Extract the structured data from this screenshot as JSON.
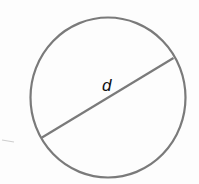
{
  "diagram": {
    "type": "circle-with-diameter",
    "circle": {
      "cx": 108,
      "cy": 97.5,
      "rx": 77.5,
      "ry": 80,
      "stroke": "#7a7a7a",
      "stroke_width": 2.2
    },
    "diameter": {
      "x1": 42,
      "y1": 137.5,
      "x2": 173.5,
      "y2": 58,
      "stroke": "#7a7a7a",
      "stroke_width": 2.2
    },
    "label": {
      "text": "d",
      "x": 102,
      "y": 77
    },
    "smudge_color": "#c8c8c8"
  }
}
